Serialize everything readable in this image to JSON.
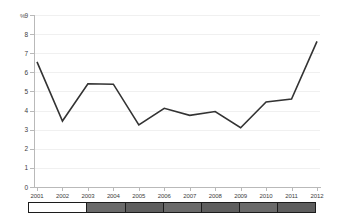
{
  "header": {
    "title": ""
  },
  "axis": {
    "y_unit_label": "%",
    "y_ticks": [
      "9",
      "8",
      "7",
      "6",
      "5",
      "4",
      "3",
      "2",
      "1",
      "0"
    ],
    "x_ticks": [
      "2001",
      "2002",
      "2003",
      "2004",
      "2005",
      "2006",
      "2007",
      "2008",
      "2009",
      "2010",
      "2011",
      "2012"
    ]
  },
  "colors": {
    "line": "#333333",
    "grid": "#f0f0f0",
    "axis": "#b9b9b9",
    "range_selected": "#6a6a6a",
    "range_unselected": "#ffffff",
    "range_border": "#1c1c1c"
  },
  "range_selector": {
    "segments": [
      {
        "state": "unselected"
      },
      {
        "state": "selected"
      },
      {
        "state": "selected"
      },
      {
        "state": "selected"
      },
      {
        "state": "selected"
      },
      {
        "state": "selected"
      },
      {
        "state": "selected"
      }
    ]
  },
  "chart_data": {
    "type": "line",
    "title": "",
    "xlabel": "",
    "ylabel": "%",
    "ylim": [
      0,
      9
    ],
    "grid": true,
    "legend": "none",
    "categories": [
      "2001",
      "2002",
      "2003",
      "2004",
      "2005",
      "2006",
      "2007",
      "2008",
      "2009",
      "2010",
      "2011",
      "2012"
    ],
    "series": [
      {
        "name": "",
        "values": [
          6.55,
          3.45,
          5.4,
          5.38,
          3.25,
          4.12,
          3.75,
          3.95,
          3.1,
          4.45,
          4.6,
          7.62
        ]
      }
    ]
  }
}
